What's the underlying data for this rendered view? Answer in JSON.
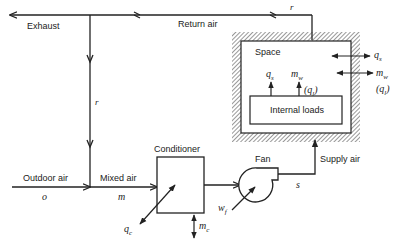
{
  "diagram": {
    "type": "hvac-air-flow-schematic",
    "nodes": {
      "space": {
        "label": "Space"
      },
      "internal_loads": {
        "label": "Internal loads"
      },
      "conditioner": {
        "label": "Conditioner"
      },
      "fan": {
        "label": "Fan"
      }
    },
    "streams": {
      "exhaust": {
        "label": "Exhaust"
      },
      "return_air": {
        "label": "Return air",
        "symbol": "r"
      },
      "recirc": {
        "symbol": "r"
      },
      "outdoor_air": {
        "label": "Outdoor air",
        "symbol": "o"
      },
      "mixed_air": {
        "label": "Mixed air",
        "symbol": "m"
      },
      "supply_air": {
        "label": "Supply air",
        "symbol": "s"
      }
    },
    "loads": {
      "internal_qs": "qₛ",
      "internal_mw": "mᵥᵥ",
      "internal_ql": "(qₗ)",
      "external_qs": "qₛ",
      "external_mw": "mᵥᵥ",
      "external_ql": "(qₗ)",
      "conditioner_qc": "q",
      "conditioner_qc_sub": "c",
      "conditioner_mc": "m",
      "conditioner_mc_sub": "c",
      "fan_wf": "w",
      "fan_wf_sub": "f",
      "q_letter": "q",
      "s_sub": "s",
      "m_letter": "m",
      "w_sub": "w",
      "l_sub": "l"
    }
  }
}
